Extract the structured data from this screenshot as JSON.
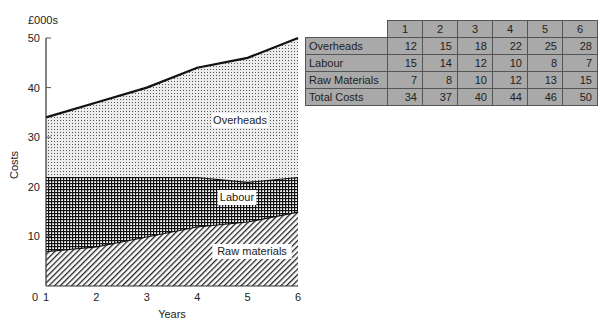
{
  "chart_data": {
    "type": "area",
    "stacked": true,
    "title": "",
    "unit_label": "£000s",
    "xlabel": "Years",
    "ylabel": "Costs",
    "x": [
      1,
      2,
      3,
      4,
      5,
      6
    ],
    "xticks": [
      "1",
      "2",
      "3",
      "4",
      "5",
      "6"
    ],
    "yticks": [
      "0",
      "10",
      "20",
      "30",
      "40",
      "50"
    ],
    "ylim": [
      0,
      50
    ],
    "grid": false,
    "series": [
      {
        "name": "Raw materials",
        "pattern": "diagonal-hatch",
        "values": [
          7,
          8,
          10,
          12,
          13,
          15
        ]
      },
      {
        "name": "Labour",
        "pattern": "cross-hatch",
        "values": [
          15,
          14,
          12,
          10,
          8,
          7
        ]
      },
      {
        "name": "Overheads",
        "pattern": "dotted",
        "values": [
          12,
          15,
          18,
          22,
          25,
          28
        ]
      }
    ],
    "area_labels": [
      "Overheads",
      "Labour",
      "Raw materials"
    ]
  },
  "table": {
    "headers": [
      "1",
      "2",
      "3",
      "4",
      "5",
      "6"
    ],
    "rows": [
      {
        "label": "Overheads",
        "values": [
          "12",
          "15",
          "18",
          "22",
          "25",
          "28"
        ]
      },
      {
        "label": "Labour",
        "values": [
          "15",
          "14",
          "12",
          "10",
          "8",
          "7"
        ]
      },
      {
        "label": "Raw Materials",
        "values": [
          "7",
          "8",
          "10",
          "12",
          "13",
          "15"
        ]
      },
      {
        "label": "Total Costs",
        "values": [
          "34",
          "37",
          "40",
          "44",
          "46",
          "50"
        ]
      }
    ]
  }
}
